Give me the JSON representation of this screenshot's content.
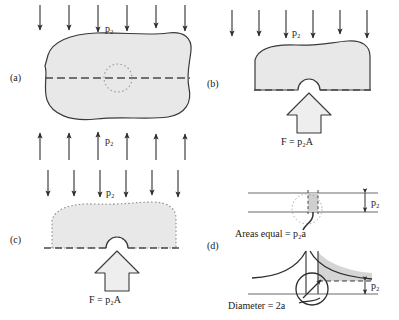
{
  "figure": {
    "panels": [
      {
        "id": "a",
        "label": "(a)",
        "caption_top": "p₂",
        "caption_bottom": "p₂",
        "description": "Irregular solid body loaded by uniform pressure p_z on top and bottom, with a dashed section plane through a small dotted circular flaw.",
        "top_arrow_count": 6,
        "bottom_arrow_count": 6,
        "arrow_direction_top": "down",
        "arrow_direction_bottom": "up",
        "section_line_style": "dashed",
        "flaw_style": "dotted-circle"
      },
      {
        "id": "b",
        "label": "(b)",
        "caption_top": "p₂",
        "force_label": "F = p₂A",
        "description": "Upper half of the body freed at the section; distributed pressure p_z on top balanced by resultant force F on the cut face, which contains a semicircular notch.",
        "top_arrow_count": 6,
        "arrow_direction_top": "down",
        "section_line_style": "dashed",
        "notch_shape": "semicircle"
      },
      {
        "id": "c",
        "label": "(c)",
        "caption_top": "p₂",
        "force_label": "F = p₂A",
        "description": "Same free body drawn with a dotted outline, showing the equivalent loading: pressure p_z above and concentrated resultant F below acting on the notched plane.",
        "top_arrow_count": 6,
        "arrow_direction_top": "down",
        "outline_style": "dotted",
        "section_line_style": "dashed",
        "notch_shape": "semicircle"
      },
      {
        "id": "d",
        "label": "(d)",
        "caption_upper": "p₂",
        "caption_lower": "p₂",
        "areas_label": "Areas equal = p₂a",
        "diameter_label": "Diameter = 2a",
        "description": "Detail of the flaw: the uniform pressure band p_z in the undisturbed body (top) is redistributed into a stress-concentration peak around the hole of diameter 2a (bottom); the shaded areas under the two distributions are equal.",
        "upper_detail": {
          "band_label": "p₂",
          "shaded_strip": true,
          "flaw_outline_style": "dotted-circle",
          "strip_edges_style": "dashed"
        },
        "lower_detail": {
          "band_label": "p₂",
          "stress_peak": "singular at hole edges",
          "baseline_style": "dashed",
          "hole_diameter_label": "2a",
          "hole_marker": "circle-with-arrow"
        }
      }
    ]
  },
  "symbols": {
    "pressure": "p₂",
    "force": "F",
    "area": "A",
    "half_flaw_width": "a"
  },
  "colors": {
    "body_fill": "#e8e8e8",
    "outline": "#3a3a3a",
    "arrow": "#2e2e2e",
    "dashed": "#4a4a4a",
    "dotted": "#8a8a8a",
    "shaded_strip": "#cfcfcf",
    "text": "#1a1a1a",
    "background": "#ffffff"
  }
}
